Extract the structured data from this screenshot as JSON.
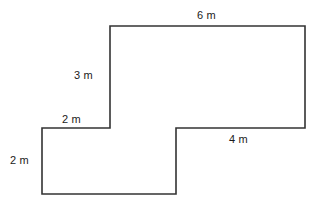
{
  "figure": {
    "stroke_color": "#333333",
    "background_color": "#ffffff",
    "stroke_width": 1.6,
    "unit": "m",
    "labels": {
      "top": "6 m",
      "upper_left_vertical": "3 m",
      "step_horizontal": "2 m",
      "lower_right_horizontal": "4 m",
      "lower_left_vertical": "2 m"
    },
    "shape": {
      "type": "polygon",
      "vertices": [
        [
          110,
          26
        ],
        [
          305,
          26
        ],
        [
          305,
          128
        ],
        [
          176,
          128
        ],
        [
          176,
          194
        ],
        [
          42,
          194
        ],
        [
          42,
          128
        ],
        [
          110,
          128
        ]
      ],
      "edges": [
        {
          "name": "top-edge",
          "from": [
            110,
            26
          ],
          "to": [
            305,
            26
          ],
          "label": "6 m",
          "orientation": "horizontal"
        },
        {
          "name": "right-edge",
          "from": [
            305,
            26
          ],
          "to": [
            305,
            128
          ],
          "label": "",
          "orientation": "vertical"
        },
        {
          "name": "lower-right-horizontal-edge",
          "from": [
            305,
            128
          ],
          "to": [
            176,
            128
          ],
          "label": "4 m",
          "orientation": "horizontal"
        },
        {
          "name": "middle-vertical-edge",
          "from": [
            176,
            128
          ],
          "to": [
            176,
            194
          ],
          "label": "",
          "orientation": "vertical"
        },
        {
          "name": "bottom-edge",
          "from": [
            176,
            194
          ],
          "to": [
            42,
            194
          ],
          "label": "",
          "orientation": "horizontal"
        },
        {
          "name": "lower-left-vertical-edge",
          "from": [
            42,
            194
          ],
          "to": [
            42,
            128
          ],
          "label": "2 m",
          "orientation": "vertical"
        },
        {
          "name": "step-horizontal-edge",
          "from": [
            42,
            128
          ],
          "to": [
            110,
            128
          ],
          "label": "2 m",
          "orientation": "horizontal"
        },
        {
          "name": "upper-left-vertical-edge",
          "from": [
            110,
            128
          ],
          "to": [
            110,
            26
          ],
          "label": "3 m",
          "orientation": "vertical"
        }
      ]
    }
  }
}
